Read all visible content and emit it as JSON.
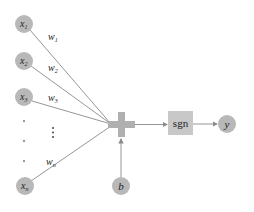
{
  "diagram": {
    "colors": {
      "node_fill": "#b8b8b8",
      "edge": "#8a8a8a",
      "sum_fill": "#b0b0b0",
      "box_fill": "#c8c8c8",
      "text": "#222222"
    },
    "inputs": [
      {
        "id": "x1",
        "base": "x",
        "sub": "1",
        "cx": 24,
        "cy": 24
      },
      {
        "id": "x2",
        "base": "x",
        "sub": "2",
        "cx": 24,
        "cy": 61
      },
      {
        "id": "x3",
        "base": "x",
        "sub": "3",
        "cx": 24,
        "cy": 97
      },
      {
        "id": "xn",
        "base": "x",
        "sub": "n",
        "cx": 25,
        "cy": 186
      }
    ],
    "weights": [
      {
        "id": "w1",
        "base": "w",
        "sub": "1",
        "x": 48,
        "y": 40
      },
      {
        "id": "w2",
        "base": "w",
        "sub": "2",
        "x": 48,
        "y": 71
      },
      {
        "id": "w3",
        "base": "w",
        "sub": "3",
        "x": 48,
        "y": 101
      },
      {
        "id": "wn",
        "base": "w",
        "sub": "n",
        "x": 46,
        "y": 165
      }
    ],
    "ellipsis_dots": [
      121,
      141,
      161
    ],
    "vertical_ellipsis": "⋮",
    "sum_node": {
      "label": "+",
      "cx": 121,
      "cy": 125
    },
    "bias": {
      "base": "b",
      "cx": 121,
      "cy": 186
    },
    "activation": {
      "label": "sgn"
    },
    "output": {
      "base": "y",
      "cx": 227,
      "cy": 124
    }
  }
}
